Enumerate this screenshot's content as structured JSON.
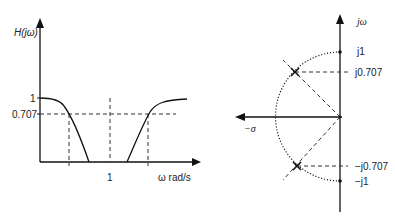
{
  "left_plot": {
    "y_axis_label": "H(jω)",
    "y_ticks": [
      {
        "label": "1",
        "value": 1
      },
      {
        "label": "0.707",
        "value": 0.707
      }
    ],
    "x_ticks": [
      {
        "label": "1",
        "value": 1
      }
    ],
    "x_axis_label": "ω rad/s",
    "description": "Band-stop magnitude response: low-pass section falls from 1, high-pass section rises to 1, with -3dB (0.707) cutoff markers"
  },
  "right_plot": {
    "vertical_axis_label": "jω",
    "horizontal_axis_label": "−σ",
    "labels": {
      "j1": "j1",
      "j0707": "j0.707",
      "neg_j0707": "−j0.707",
      "neg_j1": "−j1"
    },
    "description": "s-plane with unit-circle arc in left half-plane and two poles at 45° (−0.707 ± j0.707)"
  }
}
